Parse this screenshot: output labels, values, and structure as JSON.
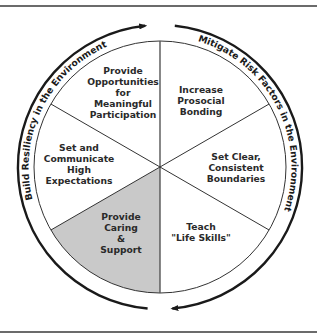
{
  "diagram": {
    "outer_arcs": {
      "left": {
        "label": "Build Resiliency in the Environment",
        "direction": "clockwise-up"
      },
      "right": {
        "label": "Mitigate Risk Factors in the Environment",
        "direction": "clockwise-down"
      }
    },
    "segments": [
      {
        "id": "top-left",
        "lines": [
          "Provide",
          "Opportunities",
          "for",
          "Meaningful",
          "Participation"
        ],
        "highlighted": false
      },
      {
        "id": "top-right",
        "lines": [
          "Increase",
          "Prosocial",
          "Bonding"
        ],
        "highlighted": false
      },
      {
        "id": "right",
        "lines": [
          "Set Clear,",
          "Consistent",
          "Boundaries"
        ],
        "highlighted": false
      },
      {
        "id": "bottom-right",
        "lines": [
          "Teach",
          "\"Life Skills\""
        ],
        "highlighted": false
      },
      {
        "id": "bottom-left",
        "lines": [
          "Provide",
          "Caring",
          "&",
          "Support"
        ],
        "highlighted": true
      },
      {
        "id": "left",
        "lines": [
          "Set and",
          "Communicate",
          "High",
          "Expectations"
        ],
        "highlighted": false
      }
    ],
    "colors": {
      "highlight_fill": "#c9c9c9",
      "line": "#333333",
      "arrow": "#1a1a1a",
      "rule": "#6b6b6b"
    }
  }
}
